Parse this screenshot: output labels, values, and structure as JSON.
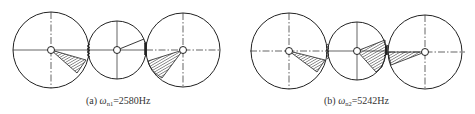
{
  "figure": {
    "panels": [
      {
        "id": "a",
        "caption": {
          "prefix": "(a) ",
          "symbol": "ω",
          "subscript": "n1",
          "value": "=2580Hz"
        },
        "mode_number": 1,
        "frequency_hz": 2580
      },
      {
        "id": "b",
        "caption": {
          "prefix": "(b) ",
          "symbol": "ω",
          "subscript": "n2",
          "value": "=5242Hz"
        },
        "mode_number": 2,
        "frequency_hz": 5242
      }
    ],
    "colors": {
      "line": "#222222",
      "hatch": "#444444",
      "background": "#ffffff"
    }
  }
}
